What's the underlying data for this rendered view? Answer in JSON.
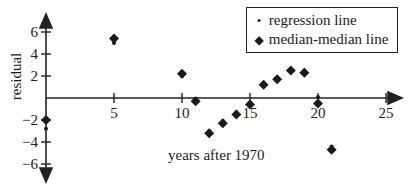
{
  "chart_data": {
    "type": "scatter",
    "title": "",
    "xlabel": "years after 1970",
    "ylabel": "residual",
    "xlim": [
      0,
      25
    ],
    "ylim": [
      -6,
      6
    ],
    "x_ticks": [
      5,
      10,
      15,
      20,
      25
    ],
    "y_ticks": [
      6,
      4,
      2,
      -2,
      -4,
      -6
    ],
    "grid": false,
    "legend_position": "top-right",
    "series": [
      {
        "name": "regression line",
        "marker": "dot",
        "points": [
          {
            "x": 0,
            "y": -2.8
          },
          {
            "x": 5,
            "y": 5.0
          },
          {
            "x": 10,
            "y": 2.0
          },
          {
            "x": 11,
            "y": -0.1
          },
          {
            "x": 12,
            "y": -3.0
          },
          {
            "x": 13,
            "y": -2.1
          },
          {
            "x": 14,
            "y": -1.3
          },
          {
            "x": 15,
            "y": -0.4
          },
          {
            "x": 16,
            "y": 1.3
          },
          {
            "x": 17,
            "y": 1.8
          },
          {
            "x": 18,
            "y": 2.6
          },
          {
            "x": 19,
            "y": 2.5
          },
          {
            "x": 20,
            "y": 0.1
          },
          {
            "x": 21,
            "y": -4.4
          }
        ]
      },
      {
        "name": "median-median line",
        "marker": "diamond",
        "points": [
          {
            "x": 0,
            "y": -2.0
          },
          {
            "x": 5,
            "y": 5.4
          },
          {
            "x": 10,
            "y": 2.2
          },
          {
            "x": 11,
            "y": -0.3
          },
          {
            "x": 12,
            "y": -3.2
          },
          {
            "x": 13,
            "y": -2.3
          },
          {
            "x": 14,
            "y": -1.5
          },
          {
            "x": 15,
            "y": -0.6
          },
          {
            "x": 16,
            "y": 1.2
          },
          {
            "x": 17,
            "y": 1.7
          },
          {
            "x": 18,
            "y": 2.5
          },
          {
            "x": 19,
            "y": 2.3
          },
          {
            "x": 20,
            "y": -0.5
          },
          {
            "x": 21,
            "y": -4.7
          }
        ]
      }
    ]
  },
  "legend": {
    "items": [
      {
        "label": "regression line",
        "marker": "•"
      },
      {
        "label": "median-median line",
        "marker": "◆"
      }
    ]
  }
}
